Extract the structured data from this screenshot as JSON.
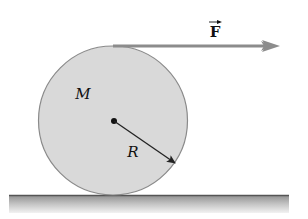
{
  "diagram": {
    "labels": {
      "force": "F",
      "mass": "M",
      "radius": "R"
    },
    "colors": {
      "disk_fill": "#d9d9d9",
      "disk_stroke": "#8a8a8a",
      "force_arrow": "#8c8c8c",
      "radius_arrow": "#222222",
      "ground_top": "#555555",
      "ground_shade_top": "#9a9a9a",
      "ground_shade_bottom": "#f0f0f0",
      "text": "#111111"
    },
    "geometry": {
      "disk": {
        "cx": 113,
        "cy": 121,
        "r": 75
      },
      "force_arrow": {
        "x1": 113,
        "y1": 46,
        "x2": 280,
        "y2": 46
      },
      "radius_arrow": {
        "x1": 113,
        "y1": 121,
        "x2": 175,
        "y2": 163
      },
      "ground": {
        "x": 9,
        "y": 195,
        "width": 280,
        "height": 18
      }
    }
  }
}
